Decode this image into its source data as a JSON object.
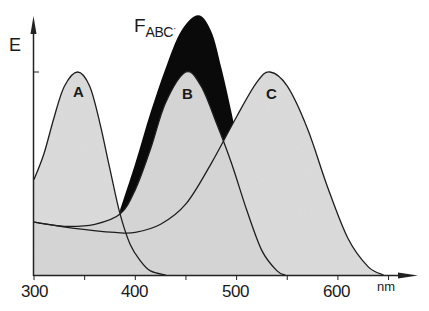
{
  "chart_data": {
    "type": "area",
    "title": "",
    "xlabel": "nm",
    "ylabel": "E",
    "xlim": [
      300,
      680
    ],
    "ylim": [
      0,
      1.35
    ],
    "x_ticks": [
      300,
      400,
      500,
      600
    ],
    "x_tick_labels": [
      "300",
      "400",
      "500",
      "600"
    ],
    "minor_x_ticks": [
      350,
      450,
      550,
      650
    ],
    "y_ticks": [
      1.0
    ],
    "grid": false,
    "legend": "none (curves labeled inline)",
    "series": [
      {
        "name": "A",
        "peak_nm": 343,
        "peak_E": 1.0,
        "points": [
          [
            300,
            0.47
          ],
          [
            310,
            0.6
          ],
          [
            320,
            0.78
          ],
          [
            330,
            0.93
          ],
          [
            343,
            1.0
          ],
          [
            355,
            0.93
          ],
          [
            365,
            0.75
          ],
          [
            375,
            0.52
          ],
          [
            385,
            0.3
          ],
          [
            395,
            0.15
          ],
          [
            405,
            0.07
          ],
          [
            415,
            0.02
          ],
          [
            430,
            0.0
          ]
        ]
      },
      {
        "name": "B",
        "peak_nm": 450,
        "peak_E": 1.0,
        "points": [
          [
            300,
            0.26
          ],
          [
            330,
            0.24
          ],
          [
            360,
            0.25
          ],
          [
            385,
            0.3
          ],
          [
            400,
            0.42
          ],
          [
            415,
            0.62
          ],
          [
            430,
            0.85
          ],
          [
            450,
            1.0
          ],
          [
            465,
            0.93
          ],
          [
            480,
            0.75
          ],
          [
            495,
            0.55
          ],
          [
            510,
            0.32
          ],
          [
            525,
            0.12
          ],
          [
            540,
            0.02
          ],
          [
            548,
            0.0
          ]
        ]
      },
      {
        "name": "C",
        "peak_nm": 533,
        "peak_E": 1.0,
        "points": [
          [
            300,
            0.26
          ],
          [
            340,
            0.23
          ],
          [
            380,
            0.21
          ],
          [
            400,
            0.21
          ],
          [
            425,
            0.25
          ],
          [
            450,
            0.35
          ],
          [
            475,
            0.55
          ],
          [
            500,
            0.78
          ],
          [
            520,
            0.95
          ],
          [
            533,
            1.0
          ],
          [
            550,
            0.93
          ],
          [
            570,
            0.72
          ],
          [
            590,
            0.43
          ],
          [
            610,
            0.18
          ],
          [
            630,
            0.04
          ],
          [
            645,
            0.0
          ]
        ]
      },
      {
        "name": "F_ABC",
        "peak_nm": 462,
        "peak_E": 1.28,
        "points": [
          [
            385,
            0.32
          ],
          [
            400,
            0.55
          ],
          [
            415,
            0.8
          ],
          [
            430,
            1.02
          ],
          [
            445,
            1.2
          ],
          [
            462,
            1.28
          ],
          [
            475,
            1.2
          ],
          [
            485,
            1.02
          ],
          [
            495,
            0.8
          ],
          [
            505,
            0.55
          ]
        ]
      }
    ],
    "annotations": [
      "A",
      "B",
      "C",
      "F_ABC"
    ]
  },
  "labels": {
    "y_axis": "E",
    "unit": "nm",
    "ticks": [
      "300",
      "400",
      "500",
      "600"
    ],
    "curve_a": "A",
    "curve_b": "B",
    "curve_c": "C",
    "f_main": "F",
    "f_sub": "ABC"
  },
  "colors": {
    "fill_light": "#dcdcdc",
    "fill_mid": "#cfcfcf",
    "envelope": "#0a0a0a",
    "line": "#1e1e1e",
    "background": "#ffffff"
  }
}
